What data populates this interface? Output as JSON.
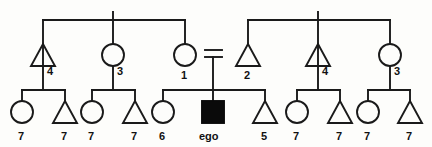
{
  "diagram": {
    "type": "kinship-pedigree-chart",
    "title": "",
    "background_color": "#fdfdfb",
    "line_color": "#1a1a1a",
    "filled_symbol_color": "#0a0a0a",
    "symbol_legend": {
      "triangle": "male",
      "circle": "female",
      "filled_square": "ego (reference individual)",
      "double_horizontal_line": "marriage union"
    },
    "generations": [
      {
        "id": "generation-1",
        "members": [
          {
            "id": "g1-left-male-4",
            "shape": "triangle",
            "label": "4",
            "cx": 43,
            "cy": 55
          },
          {
            "id": "g1-left-female-3",
            "shape": "circle",
            "label": "3",
            "cx": 113,
            "cy": 55
          },
          {
            "id": "g1-left-female-1",
            "shape": "circle",
            "label": "1",
            "cx": 185,
            "cy": 55
          },
          {
            "id": "g1-right-male-2",
            "shape": "triangle",
            "label": "2",
            "cx": 248,
            "cy": 55
          },
          {
            "id": "g1-right-male-4",
            "shape": "triangle",
            "label": "4",
            "cx": 318,
            "cy": 55
          },
          {
            "id": "g1-right-female-3",
            "shape": "circle",
            "label": "3",
            "cx": 390,
            "cy": 55
          }
        ]
      },
      {
        "id": "generation-2",
        "members": [
          {
            "id": "g2-female-7-a",
            "shape": "circle",
            "label": "7",
            "cx": 22,
            "cy": 112
          },
          {
            "id": "g2-male-7-a",
            "shape": "triangle",
            "label": "7",
            "cx": 65,
            "cy": 112
          },
          {
            "id": "g2-female-7-b",
            "shape": "circle",
            "label": "7",
            "cx": 92,
            "cy": 112
          },
          {
            "id": "g2-male-7-b",
            "shape": "triangle",
            "label": "7",
            "cx": 135,
            "cy": 112
          },
          {
            "id": "g2-female-6",
            "shape": "circle",
            "label": "6",
            "cx": 163,
            "cy": 112
          },
          {
            "id": "g2-ego",
            "shape": "square",
            "label": "ego",
            "cx": 213,
            "cy": 112,
            "filled": true
          },
          {
            "id": "g2-male-5",
            "shape": "triangle",
            "label": "5",
            "cx": 265,
            "cy": 112
          },
          {
            "id": "g2-female-7-c",
            "shape": "circle",
            "label": "7",
            "cx": 297,
            "cy": 112
          },
          {
            "id": "g2-male-7-c",
            "shape": "triangle",
            "label": "7",
            "cx": 340,
            "cy": 112
          },
          {
            "id": "g2-female-7-d",
            "shape": "circle",
            "label": "7",
            "cx": 368,
            "cy": 112
          },
          {
            "id": "g2-male-7-d",
            "shape": "triangle",
            "label": "7",
            "cx": 410,
            "cy": 112
          }
        ]
      }
    ],
    "marriage_union": {
      "id": "union-ego-parents",
      "symbol": "=",
      "x_left": 205,
      "x_right": 222,
      "y_top": 50,
      "y_bottom": 57
    },
    "labels_bottom_row": [
      "7",
      "7",
      "7",
      "7",
      "6",
      "ego",
      "5",
      "7",
      "7",
      "7",
      "7"
    ],
    "labels_upper_row": [
      "4",
      "3",
      "1",
      "2",
      "4",
      "3"
    ]
  }
}
